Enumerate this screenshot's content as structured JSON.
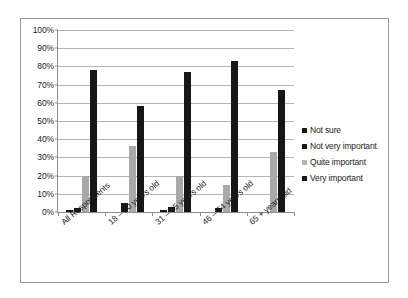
{
  "chart_data": {
    "type": "bar",
    "title": "",
    "xlabel": "",
    "ylabel": "",
    "ylim": [
      0,
      100
    ],
    "ytick_labels": [
      "0%",
      "10%",
      "20%",
      "30%",
      "40%",
      "50%",
      "60%",
      "70%",
      "80%",
      "90%",
      "100%"
    ],
    "ytick_values": [
      0,
      10,
      20,
      30,
      40,
      50,
      60,
      70,
      80,
      90,
      100
    ],
    "grid": true,
    "legend_position": "right",
    "categories": [
      "All Respondents",
      "18 – 30 years old",
      "31 – 45 years old",
      "46 – 64 years old",
      "65 + years old"
    ],
    "series": [
      {
        "name": "Not sure",
        "color": "#161616",
        "values": [
          1,
          0,
          1,
          0,
          0
        ]
      },
      {
        "name": "Not very important",
        "color": "#161616",
        "values": [
          2,
          5,
          3,
          2,
          0
        ]
      },
      {
        "name": "Quite important",
        "color": "#a9a9a9",
        "values": [
          20,
          36,
          20,
          15,
          33
        ]
      },
      {
        "name": "Very important",
        "color": "#161616",
        "values": [
          78,
          58,
          77,
          83,
          67
        ]
      }
    ]
  }
}
